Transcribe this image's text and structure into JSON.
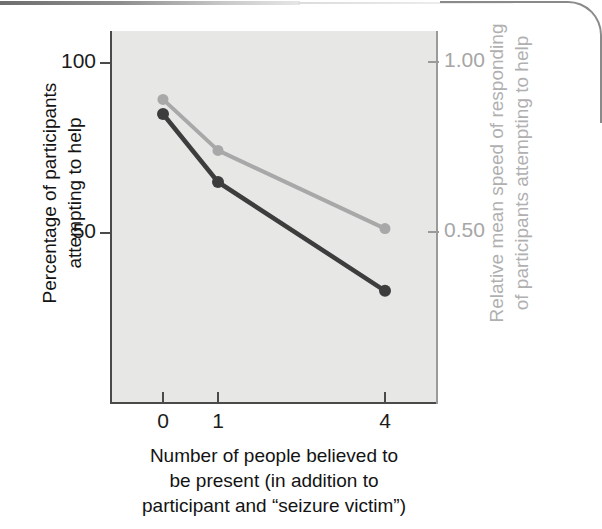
{
  "figure": {
    "kind": "two-axis-line-graph",
    "background_color": "#e7e7e5",
    "dark_series_color": "#3d3d3d",
    "light_series_color": "#a8a8a8"
  },
  "axes": {
    "left": {
      "title": "Percentage of participants\nattempting to help",
      "color": "#131313",
      "ticks": [
        {
          "label": "100",
          "value": 100
        },
        {
          "label": "50",
          "value": 50
        }
      ]
    },
    "right": {
      "title": "Relative mean speed of responding\nof participants attempting to help",
      "color": "#a6a6a6",
      "ticks": [
        {
          "label": "1.00",
          "value": 1.0
        },
        {
          "label": "0.50",
          "value": 0.5
        }
      ]
    },
    "bottom": {
      "title": "Number of people believed to\nbe present (in addition to\nparticipant and “seizure victim”)",
      "color": "#131313",
      "ticks": [
        {
          "label": "0"
        },
        {
          "label": "1"
        },
        {
          "label": "4"
        }
      ]
    }
  },
  "chart_data": {
    "type": "line",
    "title": "",
    "xlabel": "Number of people believed to be present (in addition to participant and “seizure victim”)",
    "ylabel": "Percentage of participants attempting to help",
    "y2label": "Relative mean speed of responding of participants attempting to help",
    "categories": [
      "0",
      "1",
      "4"
    ],
    "x": [
      0,
      1,
      4
    ],
    "ylim": [
      0,
      112
    ],
    "y2lim": [
      0,
      1.12
    ],
    "yticks": [
      50,
      100
    ],
    "ytick_labels": [
      "50",
      "100"
    ],
    "y2ticks": [
      0.5,
      1.0
    ],
    "y2tick_labels": [
      "0.50",
      "1.00"
    ],
    "grid": false,
    "legend": "none",
    "series": [
      {
        "name": "Percentage of participants attempting to help",
        "axis": "left",
        "color": "#3d3d3d",
        "marker": "circle",
        "values": [
          85,
          65,
          33
        ]
      },
      {
        "name": "Relative mean speed of responding of participants attempting to help",
        "axis": "right",
        "color": "#a8a8a8",
        "marker": "circle",
        "values": [
          0.89,
          0.74,
          0.51
        ]
      }
    ]
  }
}
